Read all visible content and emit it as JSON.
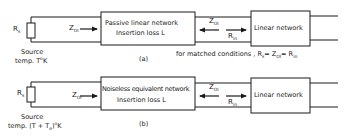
{
  "diagram_a": {
    "source": {
      "resistor_label": "R",
      "resistor_sub": "s",
      "caption_line1": "Source",
      "caption_line2_pre": "temp. T",
      "caption_line2_deg": "o",
      "caption_line2_post": "K"
    },
    "input_impedance": {
      "label": "Z",
      "sub": "OI"
    },
    "block1": {
      "line1": "Passive linear network",
      "line2": "Insertion loss L"
    },
    "output_impedance": {
      "label": "Z",
      "sub": "OI"
    },
    "input_resistance": {
      "label": "R",
      "sub": "in"
    },
    "block2": {
      "label": "Linear network"
    },
    "figure_label": "(a)",
    "condition": {
      "pre": "for matched conditions ,  R",
      "sub1": "s",
      "mid1": "= Z",
      "sub2": "OI",
      "mid2": "= R",
      "sub3": "in"
    }
  },
  "diagram_b": {
    "source": {
      "resistor_label": "R",
      "resistor_sub": "s",
      "caption_line1": "Source",
      "caption_line2_pre": "temp. (T + T",
      "caption_line2_sub": "e",
      "caption_line2_mid": ")",
      "caption_line2_deg": "o",
      "caption_line2_post": "K"
    },
    "input_impedance": {
      "label": "Z",
      "sub": "OI"
    },
    "block1": {
      "line1": "Noiseless equivalent network",
      "line2": "Insertion loss L"
    },
    "output_impedance": {
      "label": "Z",
      "sub": "OI"
    },
    "input_resistance": {
      "label": "R",
      "sub": "in"
    },
    "block2": {
      "label": "Linear network"
    },
    "figure_label": "(b)"
  }
}
